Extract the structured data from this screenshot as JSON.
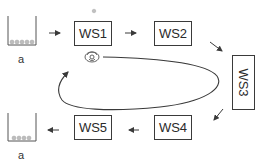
{
  "diagram": {
    "type": "workstation-loop",
    "input_bin": {
      "label": "a"
    },
    "output_bin": {
      "label": "a"
    },
    "workstations": [
      {
        "id": "WS1",
        "label": "WS1"
      },
      {
        "id": "WS2",
        "label": "WS2"
      },
      {
        "id": "WS3",
        "label": "WS3"
      },
      {
        "id": "WS4",
        "label": "WS4"
      },
      {
        "id": "WS5",
        "label": "WS5"
      }
    ],
    "flow": [
      "input_bin",
      "WS1",
      "WS2",
      "WS3",
      "WS4",
      "WS5",
      "output_bin"
    ],
    "loop": {
      "description": "closed elliptical transport loop with arrow pointing toward WS1",
      "icon": "robot-gripper-icon"
    },
    "colors": {
      "stroke": "#3a3a3a",
      "background": "#ffffff",
      "parts": "#b0b0b0"
    }
  }
}
